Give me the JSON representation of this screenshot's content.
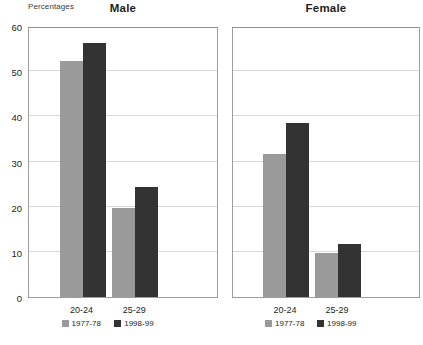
{
  "unit_label": "Percentages",
  "chart_data": {
    "type": "bar",
    "title": "",
    "subtitle": "",
    "xlabel": "",
    "ylabel": "Percentages",
    "ylim": [
      0,
      60
    ],
    "yticks": [
      0,
      10,
      20,
      30,
      40,
      50,
      60
    ],
    "ytick_labels": [
      "0",
      "10",
      "20",
      "30",
      "40",
      "50",
      "60"
    ],
    "grid": true,
    "legend_position": "bottom",
    "categories": [
      "20-24",
      "25-29"
    ],
    "series": [
      {
        "name": "1977-78",
        "color": "#9a9a9a"
      },
      {
        "name": "1998-99",
        "color": "#333333"
      }
    ],
    "panels": [
      {
        "label": "Male",
        "categories": [
          "20-24",
          "25-29"
        ],
        "series": [
          {
            "name": "1977-78",
            "values": [
              52.3,
              19.6
            ]
          },
          {
            "name": "1998-99",
            "values": [
              56.3,
              24.4
            ]
          }
        ]
      },
      {
        "label": "Female",
        "categories": [
          "20-24",
          "25-29"
        ],
        "series": [
          {
            "name": "1977-78",
            "values": [
              31.6,
              9.8
            ]
          },
          {
            "name": "1998-99",
            "values": [
              38.5,
              11.7
            ]
          }
        ]
      }
    ]
  }
}
